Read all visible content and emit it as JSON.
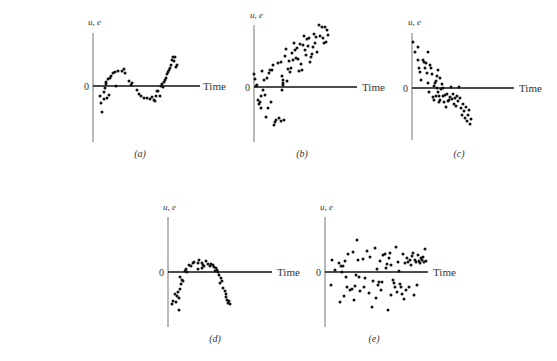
{
  "chart_data": [
    {
      "id": "a",
      "type": "scatter",
      "caption": "(a)",
      "ylabel": "u, e",
      "xlabel": "Time",
      "zero_label": "0",
      "pattern": "cyclical (sinusoidal)",
      "geometry": {
        "axis_x": 93,
        "axis_top": 33,
        "axis_bottom": 142,
        "zero_y": 86,
        "line_end_x": 200,
        "time_x": 203,
        "caption_x": 140,
        "caption_y": 157,
        "ylabel_x": 88,
        "ylabel_y": 25
      },
      "points": [
        [
          100,
          96
        ],
        [
          101,
          103
        ],
        [
          102,
          112
        ],
        [
          104,
          99
        ],
        [
          104,
          92
        ],
        [
          105,
          88
        ],
        [
          106,
          84
        ],
        [
          106,
          82
        ],
        [
          107,
          98
        ],
        [
          108,
          79
        ],
        [
          109,
          95
        ],
        [
          110,
          78
        ],
        [
          111,
          76
        ],
        [
          113,
          73
        ],
        [
          115,
          72
        ],
        [
          116,
          86
        ],
        [
          118,
          71
        ],
        [
          122,
          71
        ],
        [
          124,
          69
        ],
        [
          125,
          73
        ],
        [
          129,
          81
        ],
        [
          131,
          85
        ],
        [
          132,
          83
        ],
        [
          137,
          90
        ],
        [
          139,
          94
        ],
        [
          141,
          96
        ],
        [
          144,
          98
        ],
        [
          147,
          98
        ],
        [
          150,
          99
        ],
        [
          152,
          97
        ],
        [
          154,
          100
        ],
        [
          155,
          101
        ],
        [
          156,
          96
        ],
        [
          157,
          91
        ],
        [
          158,
          91
        ],
        [
          160,
          96
        ],
        [
          161,
          86
        ],
        [
          162,
          84
        ],
        [
          163,
          87
        ],
        [
          164,
          82
        ],
        [
          165,
          80
        ],
        [
          166,
          78
        ],
        [
          167,
          74
        ],
        [
          168,
          72
        ],
        [
          169,
          70
        ],
        [
          170,
          68
        ],
        [
          171,
          65
        ],
        [
          172,
          60
        ],
        [
          173,
          57
        ],
        [
          174,
          61
        ],
        [
          175,
          57
        ],
        [
          176,
          67
        ],
        [
          177,
          65
        ]
      ]
    },
    {
      "id": "b",
      "type": "scatter",
      "caption": "(b)",
      "ylabel": "u, e",
      "xlabel": "Time",
      "zero_label": "0",
      "pattern": "linear upward trend",
      "geometry": {
        "axis_x": 254,
        "axis_top": 25,
        "axis_bottom": 142,
        "zero_y": 87,
        "line_end_x": 357,
        "time_x": 362,
        "caption_x": 302,
        "caption_y": 157,
        "ylabel_x": 250,
        "ylabel_y": 18
      },
      "points": [
        [
          254,
          74
        ],
        [
          255,
          79
        ],
        [
          256,
          86
        ],
        [
          257,
          85
        ],
        [
          258,
          100
        ],
        [
          259,
          104
        ],
        [
          260,
          102
        ],
        [
          261,
          96
        ],
        [
          261,
          108
        ],
        [
          262,
          71
        ],
        [
          263,
          90
        ],
        [
          264,
          80
        ],
        [
          265,
          95
        ],
        [
          266,
          117
        ],
        [
          267,
          78
        ],
        [
          268,
          108
        ],
        [
          269,
          73
        ],
        [
          270,
          70
        ],
        [
          271,
          102
        ],
        [
          272,
          70
        ],
        [
          273,
          65
        ],
        [
          274,
          125
        ],
        [
          275,
          122
        ],
        [
          276,
          120
        ],
        [
          278,
          63
        ],
        [
          279,
          118
        ],
        [
          281,
          121
        ],
        [
          283,
          80
        ],
        [
          284,
          120
        ],
        [
          281,
          62
        ],
        [
          282,
          76
        ],
        [
          282,
          90
        ],
        [
          283,
          83
        ],
        [
          283,
          85
        ],
        [
          285,
          56
        ],
        [
          286,
          49
        ],
        [
          287,
          81
        ],
        [
          288,
          69
        ],
        [
          289,
          61
        ],
        [
          290,
          72
        ],
        [
          291,
          68
        ],
        [
          292,
          53
        ],
        [
          293,
          60
        ],
        [
          294,
          43
        ],
        [
          295,
          50
        ],
        [
          296,
          58
        ],
        [
          297,
          48
        ],
        [
          298,
          59
        ],
        [
          299,
          71
        ],
        [
          300,
          44
        ],
        [
          301,
          64
        ],
        [
          302,
          70
        ],
        [
          303,
          45
        ],
        [
          304,
          36
        ],
        [
          305,
          50
        ],
        [
          306,
          55
        ],
        [
          307,
          39
        ],
        [
          308,
          46
        ],
        [
          309,
          38
        ],
        [
          310,
          62
        ],
        [
          311,
          57
        ],
        [
          312,
          54
        ],
        [
          313,
          47
        ],
        [
          314,
          34
        ],
        [
          315,
          43
        ],
        [
          316,
          37
        ],
        [
          317,
          52
        ],
        [
          319,
          25
        ],
        [
          320,
          36
        ],
        [
          322,
          27
        ],
        [
          323,
          38
        ],
        [
          324,
          43
        ],
        [
          325,
          27
        ],
        [
          326,
          42
        ],
        [
          327,
          30
        ],
        [
          328,
          35
        ]
      ]
    },
    {
      "id": "c",
      "type": "scatter",
      "caption": "(c)",
      "ylabel": "u, e",
      "xlabel": "Time",
      "zero_label": "0",
      "pattern": "linear downward trend",
      "geometry": {
        "axis_x": 412,
        "axis_top": 33,
        "axis_bottom": 140,
        "zero_y": 88,
        "line_end_x": 514,
        "time_x": 519,
        "caption_x": 459,
        "caption_y": 157,
        "ylabel_x": 408,
        "ylabel_y": 25
      },
      "points": [
        [
          413,
          42
        ],
        [
          415,
          52
        ],
        [
          418,
          47
        ],
        [
          418,
          60
        ],
        [
          419,
          68
        ],
        [
          420,
          72
        ],
        [
          421,
          80
        ],
        [
          423,
          60
        ],
        [
          424,
          62
        ],
        [
          425,
          68
        ],
        [
          426,
          63
        ],
        [
          427,
          73
        ],
        [
          428,
          52
        ],
        [
          428,
          83
        ],
        [
          429,
          92
        ],
        [
          430,
          65
        ],
        [
          431,
          68
        ],
        [
          432,
          74
        ],
        [
          433,
          97
        ],
        [
          434,
          86
        ],
        [
          434,
          100
        ],
        [
          435,
          83
        ],
        [
          436,
          81
        ],
        [
          436,
          96
        ],
        [
          437,
          76
        ],
        [
          437,
          88
        ],
        [
          438,
          70
        ],
        [
          438,
          92
        ],
        [
          439,
          96
        ],
        [
          439,
          102
        ],
        [
          440,
          78
        ],
        [
          440,
          100
        ],
        [
          441,
          89
        ],
        [
          442,
          84
        ],
        [
          443,
          96
        ],
        [
          443,
          88
        ],
        [
          444,
          102
        ],
        [
          445,
          95
        ],
        [
          446,
          107
        ],
        [
          447,
          94
        ],
        [
          448,
          101
        ],
        [
          449,
          100
        ],
        [
          450,
          97
        ],
        [
          451,
          87
        ],
        [
          452,
          99
        ],
        [
          453,
          94
        ],
        [
          454,
          104
        ],
        [
          455,
          98
        ],
        [
          456,
          106
        ],
        [
          457,
          96
        ],
        [
          458,
          101
        ],
        [
          459,
          87
        ],
        [
          460,
          98
        ],
        [
          461,
          108
        ],
        [
          462,
          115
        ],
        [
          463,
          104
        ],
        [
          464,
          111
        ],
        [
          465,
          118
        ],
        [
          466,
          107
        ],
        [
          467,
          121
        ],
        [
          468,
          115
        ],
        [
          469,
          110
        ],
        [
          470,
          124
        ],
        [
          471,
          119
        ]
      ]
    },
    {
      "id": "d",
      "type": "scatter",
      "caption": "(d)",
      "ylabel": "u, e",
      "xlabel": "Time",
      "zero_label": "0",
      "pattern": "quadratic (inverted U)",
      "geometry": {
        "axis_x": 168,
        "axis_top": 217,
        "axis_bottom": 327,
        "zero_y": 272,
        "line_end_x": 272,
        "time_x": 277,
        "caption_x": 215,
        "caption_y": 342,
        "ylabel_x": 163,
        "ylabel_y": 210
      },
      "points": [
        [
          172,
          304
        ],
        [
          173,
          301
        ],
        [
          175,
          294
        ],
        [
          176,
          302
        ],
        [
          177,
          296
        ],
        [
          178,
          292
        ],
        [
          179,
          298
        ],
        [
          179,
          310
        ],
        [
          180,
          289
        ],
        [
          180,
          277
        ],
        [
          181,
          284
        ],
        [
          182,
          280
        ],
        [
          183,
          281
        ],
        [
          185,
          271
        ],
        [
          186,
          269
        ],
        [
          187,
          272
        ],
        [
          189,
          265
        ],
        [
          191,
          266
        ],
        [
          193,
          263
        ],
        [
          194,
          262
        ],
        [
          198,
          263
        ],
        [
          198,
          269
        ],
        [
          199,
          260
        ],
        [
          202,
          263
        ],
        [
          202,
          268
        ],
        [
          203,
          265
        ],
        [
          204,
          266
        ],
        [
          206,
          261
        ],
        [
          208,
          264
        ],
        [
          210,
          266
        ],
        [
          211,
          264
        ],
        [
          213,
          265
        ],
        [
          214,
          267
        ],
        [
          215,
          271
        ],
        [
          216,
          268
        ],
        [
          217,
          270
        ],
        [
          218,
          272
        ],
        [
          219,
          275
        ],
        [
          220,
          283
        ],
        [
          221,
          278
        ],
        [
          222,
          281
        ],
        [
          223,
          288
        ],
        [
          225,
          291
        ],
        [
          226,
          294
        ],
        [
          226,
          297
        ],
        [
          227,
          300
        ],
        [
          228,
          303
        ],
        [
          229,
          301
        ],
        [
          230,
          304
        ]
      ]
    },
    {
      "id": "e",
      "type": "scatter",
      "caption": "(e)",
      "ylabel": "u, e",
      "xlabel": "Time",
      "zero_label": "0",
      "pattern": "no systematic pattern (random)",
      "geometry": {
        "axis_x": 325,
        "axis_top": 217,
        "axis_bottom": 327,
        "zero_y": 272,
        "line_end_x": 428,
        "time_x": 433,
        "caption_x": 374,
        "caption_y": 342,
        "ylabel_x": 320,
        "ylabel_y": 210
      },
      "points": [
        [
          332,
          260
        ],
        [
          331,
          285
        ],
        [
          335,
          270
        ],
        [
          339,
          263
        ],
        [
          340,
          302
        ],
        [
          341,
          266
        ],
        [
          342,
          272
        ],
        [
          343,
          266
        ],
        [
          344,
          296
        ],
        [
          345,
          261
        ],
        [
          346,
          277
        ],
        [
          347,
          287
        ],
        [
          348,
          254
        ],
        [
          350,
          290
        ],
        [
          352,
          289
        ],
        [
          353,
          252
        ],
        [
          354,
          300
        ],
        [
          355,
          286
        ],
        [
          356,
          275
        ],
        [
          357,
          240
        ],
        [
          358,
          260
        ],
        [
          359,
          277
        ],
        [
          360,
          291
        ],
        [
          363,
          259
        ],
        [
          364,
          287
        ],
        [
          365,
          278
        ],
        [
          367,
          251
        ],
        [
          369,
          293
        ],
        [
          370,
          257
        ],
        [
          372,
          307
        ],
        [
          373,
          281
        ],
        [
          375,
          248
        ],
        [
          376,
          298
        ],
        [
          377,
          269
        ],
        [
          378,
          285
        ],
        [
          379,
          282
        ],
        [
          380,
          261
        ],
        [
          381,
          290
        ],
        [
          382,
          282
        ],
        [
          383,
          255
        ],
        [
          385,
          254
        ],
        [
          386,
          268
        ],
        [
          387,
          264
        ],
        [
          388,
          310
        ],
        [
          389,
          258
        ],
        [
          390,
          253
        ],
        [
          391,
          265
        ],
        [
          391,
          295
        ],
        [
          393,
          280
        ],
        [
          394,
          283
        ],
        [
          395,
          287
        ],
        [
          396,
          247
        ],
        [
          397,
          292
        ],
        [
          398,
          262
        ],
        [
          399,
          271
        ],
        [
          400,
          284
        ],
        [
          401,
          287
        ],
        [
          402,
          294
        ],
        [
          403,
          254
        ],
        [
          404,
          299
        ],
        [
          405,
          263
        ],
        [
          406,
          290
        ],
        [
          407,
          258
        ],
        [
          408,
          262
        ],
        [
          409,
          287
        ],
        [
          410,
          260
        ],
        [
          411,
          265
        ],
        [
          412,
          256
        ],
        [
          413,
          253
        ],
        [
          414,
          295
        ],
        [
          415,
          260
        ],
        [
          416,
          262
        ],
        [
          417,
          285
        ],
        [
          418,
          255
        ],
        [
          419,
          261
        ],
        [
          420,
          263
        ],
        [
          421,
          258
        ],
        [
          422,
          260
        ],
        [
          423,
          257
        ],
        [
          424,
          262
        ],
        [
          425,
          249
        ],
        [
          426,
          261
        ]
      ]
    }
  ]
}
